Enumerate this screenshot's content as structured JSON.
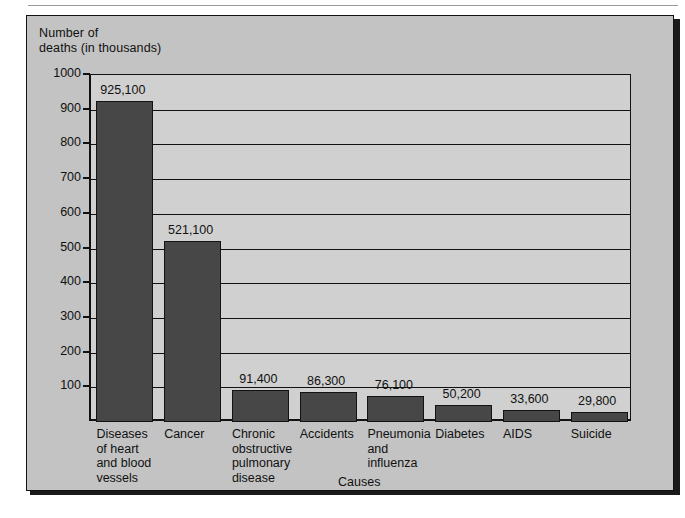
{
  "chart_data": {
    "type": "bar",
    "title": "",
    "ylabel": "Number of\ndeaths (in thousands)",
    "xlabel": "Causes",
    "categories": [
      "Diseases\nof heart\nand blood\nvessels",
      "Cancer",
      "Chronic\nobstructive\npulmonary\ndisease",
      "Accidents",
      "Pneumonia\nand\ninfluenza",
      "Diabetes",
      "AIDS",
      "Suicide"
    ],
    "values": [
      925100,
      521100,
      91400,
      86300,
      76100,
      50200,
      33600,
      29800
    ],
    "value_labels": [
      "925,100",
      "521,100",
      "91,400",
      "86,300",
      "76,100",
      "50,200",
      "33,600",
      "29,800"
    ],
    "ylim": [
      0,
      1000
    ],
    "y_ticks": [
      100,
      200,
      300,
      400,
      500,
      600,
      700,
      800,
      900,
      1000
    ],
    "y_tick_labels": [
      "100",
      "200",
      "300",
      "400",
      "500",
      "600",
      "700",
      "800",
      "900",
      "1000"
    ],
    "units_note": "values plotted in thousands",
    "grid": true,
    "legend": "none",
    "colors": {
      "bar_fill": "#474747",
      "bar_stroke": "#131313",
      "plot_background": "#d0d0d0",
      "panel_background": "#c3c3c3",
      "axis": "#111111",
      "text": "#111111"
    }
  }
}
